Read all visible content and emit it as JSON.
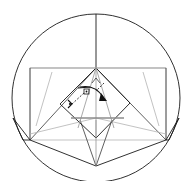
{
  "figure": {
    "canvas": {
      "width": 193,
      "height": 181
    },
    "colors": {
      "outline": "#1a1a1a",
      "crease_light": "#9a9a9a",
      "crease_mid": "#8c8c8c",
      "annotation": "#111111",
      "background": "#ffffff"
    },
    "shapes": {
      "circle": {
        "name": "bounding-circle",
        "cx": 96,
        "cy": 98,
        "r": 84
      },
      "rectangle": {
        "name": "inscribed-rectangle",
        "x": 30,
        "y": 68,
        "width": 136,
        "height": 72
      },
      "inner_diamond": {
        "name": "rotated-inner-square",
        "points": "96,68 130,103 96,138 60,104"
      },
      "center_vertical": {
        "name": "vertical-axis",
        "x": 96,
        "y1": 14,
        "y2": 68
      },
      "horizontal_mid": {
        "name": "horizontal-mid-crease",
        "x1": 70,
        "x2": 124,
        "y": 118
      },
      "bottom_apex": {
        "x": 96,
        "y": 166
      }
    },
    "annotations": {
      "right_angle_mark": {
        "name": "right-angle-square",
        "x": 86,
        "y": 89
      },
      "small_angle_mark": {
        "name": "angle-tick",
        "x": 70,
        "y": 103
      },
      "curved_arrow": {
        "name": "fold-rotation-arrow"
      },
      "dashed_guides": {
        "name": "dashed-construction-lines"
      }
    }
  }
}
